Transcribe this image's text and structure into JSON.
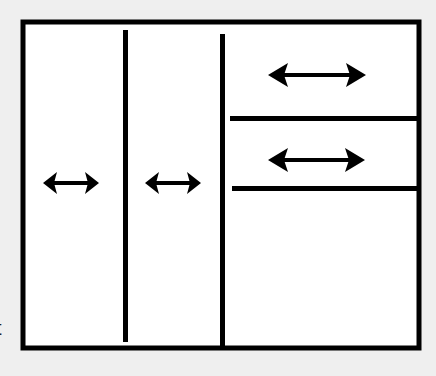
{
  "diagram": {
    "background": "#efefef",
    "frame_color": "#ffffff",
    "stroke_color": "#000000",
    "edge_text": "t",
    "panes": [
      {
        "id": "left-pane",
        "arrow": "horizontal-double-arrow"
      },
      {
        "id": "middle-pane",
        "arrow": "horizontal-double-arrow"
      },
      {
        "id": "right-top-pane",
        "arrow": "horizontal-double-arrow"
      },
      {
        "id": "right-middle-pane",
        "arrow": "horizontal-double-arrow"
      },
      {
        "id": "right-bottom-pane",
        "arrow": null
      }
    ]
  }
}
